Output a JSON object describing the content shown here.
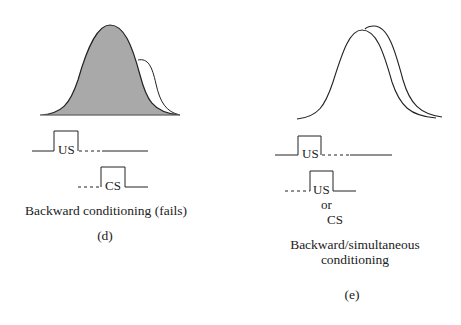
{
  "panel_d": {
    "stimulus_labels": {
      "us": "US",
      "cs": "CS"
    },
    "caption": "Backward conditioning (fails)",
    "panel_label": "(d)",
    "colors": {
      "response_fill": "#a9a9a9",
      "stroke": "#222222"
    }
  },
  "panel_e": {
    "stimulus_labels": {
      "us": "US",
      "second": "US",
      "or": "or",
      "cs": "CS"
    },
    "caption_line1": "Backward/simultaneous",
    "caption_line2": "conditioning",
    "panel_label": "(e)",
    "colors": {
      "stroke": "#222222"
    }
  }
}
